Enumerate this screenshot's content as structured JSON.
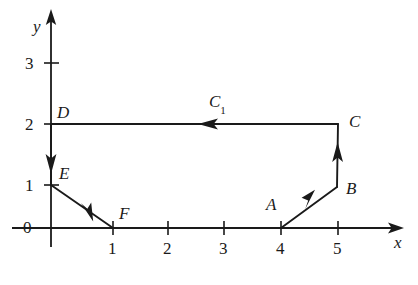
{
  "figure": {
    "axes": {
      "x_label": "x",
      "y_label": "y",
      "x_ticks": [
        "1",
        "2",
        "3",
        "4",
        "5"
      ],
      "y_ticks": [
        "1",
        "2",
        "3"
      ],
      "origin_label": "0",
      "x_range": [
        0,
        5.6
      ],
      "y_range": [
        0,
        3.6
      ]
    },
    "points": [
      {
        "name": "A",
        "label": "A",
        "x": 4,
        "y": 0
      },
      {
        "name": "B",
        "label": "B",
        "x": 5,
        "y": 1
      },
      {
        "name": "C",
        "label": "C",
        "x": 5,
        "y": 2
      },
      {
        "name": "D",
        "label": "D",
        "x": 0,
        "y": 2
      },
      {
        "name": "E",
        "label": "E",
        "x": 0,
        "y": 1
      },
      {
        "name": "F",
        "label": "F",
        "x": 1,
        "y": 0
      }
    ],
    "curve_label": "C",
    "curve_label_subscript": "1",
    "segments": [
      {
        "name": "A-to-B",
        "from": "A",
        "to": "B",
        "direction": "up-right",
        "arrow": "midpoint"
      },
      {
        "name": "B-to-C",
        "from": "B",
        "to": "C",
        "direction": "up",
        "arrow": "midpoint"
      },
      {
        "name": "C-to-D",
        "from": "C",
        "to": "D",
        "direction": "left",
        "arrow": "midpoint"
      },
      {
        "name": "D-to-E",
        "from": "D",
        "to": "E",
        "direction": "down",
        "arrow": "midpoint"
      },
      {
        "name": "E-to-F",
        "from": "E",
        "to": "F",
        "direction": "down-right",
        "arrow": "midpoint"
      }
    ],
    "colors": {
      "ink": "#1a1a1a",
      "background": "#ffffff"
    }
  }
}
